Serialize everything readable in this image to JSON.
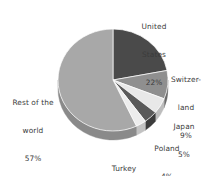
{
  "background_color": "#ffffff",
  "chart_data": {
    "type": "pie",
    "title": "",
    "subtitle": "",
    "xlabel": "",
    "ylabel": "",
    "legend_position": "none",
    "grid": false,
    "three_d": true,
    "value_unit": "%",
    "start_angle_deg": 0,
    "direction": "clockwise",
    "categories": [
      "United States",
      "Switzerland",
      "Japan",
      "Poland",
      "Turkey",
      "Rest of the world"
    ],
    "values": [
      22,
      9,
      5,
      4,
      3,
      57
    ],
    "total": 100,
    "colors": [
      "#4a4a4a",
      "#8f8f8f",
      "#e8e8e8",
      "#5a5a5a",
      "#ededed",
      "#a8a8a8"
    ],
    "side_colors": [
      "#2e2e2e",
      "#6b6b6b",
      "#bdbdbd",
      "#3c3c3c",
      "#c2c2c2",
      "#8a8a8a"
    ],
    "slices": [
      {
        "name": "United States",
        "value": 22,
        "value_label": "22%",
        "label_line1": "United",
        "label_line2": "States",
        "color": "#4a4a4a",
        "side_color": "#2e2e2e"
      },
      {
        "name": "Switzerland",
        "value": 9,
        "value_label": "9%",
        "label_line1": "Switzer-",
        "label_line2": "land",
        "color": "#8f8f8f",
        "side_color": "#6b6b6b"
      },
      {
        "name": "Japan",
        "value": 5,
        "value_label": "5%",
        "label_line1": "Japan",
        "label_line2": "",
        "color": "#e8e8e8",
        "side_color": "#bdbdbd"
      },
      {
        "name": "Poland",
        "value": 4,
        "value_label": "4%",
        "label_line1": "Poland",
        "label_line2": "",
        "color": "#5a5a5a",
        "side_color": "#3c3c3c"
      },
      {
        "name": "Turkey",
        "value": 3,
        "value_label": "3%",
        "label_line1": "Turkey",
        "label_line2": "",
        "color": "#ededed",
        "side_color": "#c2c2c2"
      },
      {
        "name": "Rest of the world",
        "value": 57,
        "value_label": "57%",
        "label_line1": "Rest of the",
        "label_line2": "world",
        "color": "#a8a8a8",
        "side_color": "#8a8a8a"
      }
    ],
    "text_color": "#3b3b3b"
  },
  "geometry": {
    "center_x": 113,
    "center_y": 80,
    "radius_x": 55,
    "radius_y": 51,
    "depth": 9
  }
}
